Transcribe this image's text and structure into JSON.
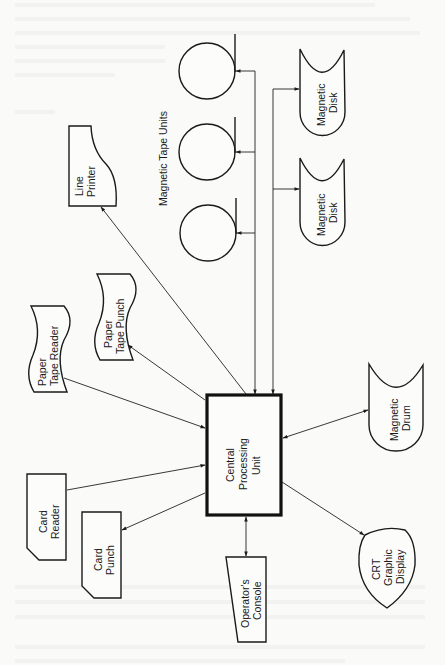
{
  "diagram": {
    "colors": {
      "ink": "#1a1a1a",
      "paper": "#fafaf8"
    },
    "group_label": "Magnetic Tape Units",
    "nodes": {
      "cpu": {
        "lines": [
          "Central",
          "Processing",
          "Unit"
        ],
        "shape": "rectangle"
      },
      "tape1": {
        "label": "",
        "shape": "tape-reel"
      },
      "tape2": {
        "label": "",
        "shape": "tape-reel"
      },
      "tape3": {
        "label": "",
        "shape": "tape-reel"
      },
      "disk1": {
        "lines": [
          "Magnetic",
          "Disk"
        ],
        "shape": "disk"
      },
      "disk2": {
        "lines": [
          "Magnetic",
          "Disk"
        ],
        "shape": "disk"
      },
      "drum": {
        "lines": [
          "Magnetic",
          "Drum"
        ],
        "shape": "disk"
      },
      "crt": {
        "lines": [
          "CRT",
          "Graphic",
          "Display"
        ],
        "shape": "display"
      },
      "console": {
        "lines": [
          "Operator's",
          "Console"
        ],
        "shape": "manual-input"
      },
      "card_reader": {
        "lines": [
          "Card",
          "Reader"
        ],
        "shape": "punched-card"
      },
      "card_punch": {
        "lines": [
          "Card",
          "Punch"
        ],
        "shape": "punched-card"
      },
      "pt_reader": {
        "lines": [
          "Paper",
          "Tape Reader"
        ],
        "shape": "punched-tape"
      },
      "pt_punch": {
        "lines": [
          "Paper",
          "Tape Punch"
        ],
        "shape": "punched-tape"
      },
      "printer": {
        "lines": [
          "Line",
          "Printer"
        ],
        "shape": "document"
      }
    },
    "edges": [
      {
        "from": "cpu",
        "to": "tape1",
        "direction": "to"
      },
      {
        "from": "cpu",
        "to": "tape2",
        "direction": "to"
      },
      {
        "from": "cpu",
        "to": "tape3",
        "direction": "to"
      },
      {
        "from": "tape_bus",
        "to": "cpu",
        "direction": "to"
      },
      {
        "from": "cpu",
        "to": "disk1",
        "direction": "to"
      },
      {
        "from": "cpu",
        "to": "disk2",
        "direction": "to"
      },
      {
        "from": "disk_bus",
        "to": "cpu",
        "direction": "to"
      },
      {
        "from": "cpu",
        "to": "drum",
        "direction": "both"
      },
      {
        "from": "cpu",
        "to": "crt",
        "direction": "to"
      },
      {
        "from": "cpu",
        "to": "console",
        "direction": "both"
      },
      {
        "from": "card_reader",
        "to": "cpu",
        "direction": "to"
      },
      {
        "from": "cpu",
        "to": "card_punch",
        "direction": "to"
      },
      {
        "from": "pt_reader",
        "to": "cpu",
        "direction": "to"
      },
      {
        "from": "cpu",
        "to": "pt_punch",
        "direction": "to"
      },
      {
        "from": "cpu",
        "to": "printer",
        "direction": "to"
      }
    ]
  }
}
